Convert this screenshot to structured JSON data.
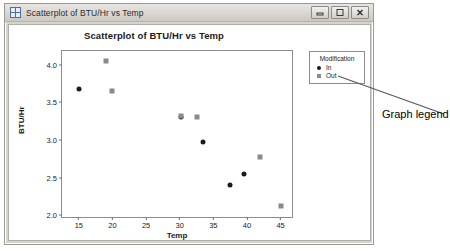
{
  "window": {
    "title": "Scatterplot of BTU/Hr vs Temp",
    "icon": "minitab-graph-icon",
    "buttons": [
      {
        "name": "minimize-button",
        "glyph": "minimize"
      },
      {
        "name": "maximize-button",
        "glyph": "maximize"
      },
      {
        "name": "close-button",
        "glyph": "close"
      }
    ]
  },
  "annotation": {
    "text": "Graph legend"
  },
  "chart_data": {
    "type": "scatter",
    "title": "Scatterplot of BTU/Hr vs Temp",
    "xlabel": "Temp",
    "ylabel": "BTU/Hr",
    "xlim": [
      12.5,
      47
    ],
    "ylim": [
      1.95,
      4.18
    ],
    "xticks": [
      15,
      20,
      25,
      30,
      35,
      40,
      45
    ],
    "yticks": [
      "2.0",
      "2.5",
      "3.0",
      "3.5",
      "4.0"
    ],
    "ytick_values": [
      2.0,
      2.5,
      3.0,
      3.5,
      4.0
    ],
    "grid": false,
    "legend": {
      "title": "Modification",
      "position": "outside-right-top",
      "entries": [
        {
          "label": "In",
          "marker": "circle",
          "color": "#1b1b1b"
        },
        {
          "label": "Out",
          "marker": "square",
          "color": "#8a8a8a"
        }
      ]
    },
    "series": [
      {
        "name": "In",
        "marker": "circle",
        "color": "#1b1b1b",
        "points": [
          {
            "x": 15.0,
            "y": 3.68
          },
          {
            "x": 30.2,
            "y": 3.3
          },
          {
            "x": 33.5,
            "y": 2.97
          },
          {
            "x": 37.5,
            "y": 2.4
          },
          {
            "x": 39.5,
            "y": 2.55
          }
        ]
      },
      {
        "name": "Out",
        "marker": "square",
        "color": "#8a8a8a",
        "points": [
          {
            "x": 19.0,
            "y": 4.05
          },
          {
            "x": 20.0,
            "y": 3.65
          },
          {
            "x": 30.2,
            "y": 3.32
          },
          {
            "x": 32.6,
            "y": 3.3
          },
          {
            "x": 42.0,
            "y": 2.77
          },
          {
            "x": 45.0,
            "y": 2.12
          }
        ]
      }
    ]
  }
}
